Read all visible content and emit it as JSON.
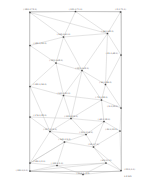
{
  "figure": {
    "type": "node-link-graph",
    "background_color": "#ffffff",
    "frame_color": "#9a9a9a",
    "edge_color": "#b0b0b0",
    "node_color": "#444444",
    "label_color": "#5a5a5a",
    "width": 146,
    "height": 187,
    "frame": {
      "x": 29.5,
      "y": 11.5,
      "width": 92,
      "height": 160
    }
  },
  "chart_data": {
    "type": "scatter",
    "title": "",
    "xlabel": "",
    "ylabel": "",
    "grid": false,
    "legend": "none",
    "nodes": [
      {
        "id": "n1",
        "label": "(-180.0,72.0)",
        "x": 30.0,
        "y": 12.5,
        "label_x": 30.0,
        "label_y": 10.0,
        "label_align": "center"
      },
      {
        "id": "n2",
        "label": "(-131.0,71.0)",
        "x": 75.5,
        "y": 11.5,
        "label_x": 75.5,
        "label_y": 10.0,
        "label_align": "center"
      },
      {
        "id": "n3",
        "label": "(-2.0,71.0)",
        "x": 120.5,
        "y": 12.0,
        "label_x": 120.5,
        "label_y": 10.0,
        "label_align": "center"
      },
      {
        "id": "n4",
        "label": "(-44.0,62.0)",
        "x": 107.5,
        "y": 33.5,
        "label_x": 107.5,
        "label_y": 31.5,
        "label_align": "center"
      },
      {
        "id": "n5",
        "label": "(-149.0,61.0)",
        "x": 63.5,
        "y": 37.0,
        "label_x": 63.5,
        "label_y": 35.0,
        "label_align": "center"
      },
      {
        "id": "n6",
        "label": "(-181.0,55.0)",
        "x": 30.0,
        "y": 45.5,
        "label_x": 33.0,
        "label_y": 44.0,
        "label_align": "left"
      },
      {
        "id": "n7",
        "label": "(-21.0,48.0)",
        "x": 121.0,
        "y": 55.0,
        "label_x": 118.0,
        "label_y": 53.5,
        "label_align": "right"
      },
      {
        "id": "n8",
        "label": "(-155.0,48.0)",
        "x": 56.0,
        "y": 63.0,
        "label_x": 56.0,
        "label_y": 61.0,
        "label_align": "center"
      },
      {
        "id": "n9",
        "label": "(-121.0,42.0)",
        "x": 82.0,
        "y": 70.5,
        "label_x": 82.0,
        "label_y": 68.5,
        "label_align": "center"
      },
      {
        "id": "n10",
        "label": "(-60.0,36.0)",
        "x": 105.5,
        "y": 84.5,
        "label_x": 105.5,
        "label_y": 82.5,
        "label_align": "center"
      },
      {
        "id": "n11",
        "label": "(-181.0,34.0)",
        "x": 30.0,
        "y": 86.5,
        "label_x": 33.0,
        "label_y": 85.0,
        "label_align": "left"
      },
      {
        "id": "n12",
        "label": "(-141.0,31.0)",
        "x": 63.5,
        "y": 95.5,
        "label_x": 63.5,
        "label_y": 93.5,
        "label_align": "center"
      },
      {
        "id": "n13",
        "label": "(-73.0,28.0)",
        "x": 101.5,
        "y": 100.0,
        "label_x": 101.5,
        "label_y": 98.0,
        "label_align": "center"
      },
      {
        "id": "n14",
        "label": "(-9.0,25.0)",
        "x": 121.0,
        "y": 108.0,
        "label_x": 118.0,
        "label_y": 106.5,
        "label_align": "right"
      },
      {
        "id": "n15",
        "label": "(-176.0,22.0)",
        "x": 30.0,
        "y": 117.0,
        "label_x": 33.0,
        "label_y": 115.5,
        "label_align": "left"
      },
      {
        "id": "n16",
        "label": "(-135.0,22.0)",
        "x": 71.0,
        "y": 118.5,
        "label_x": 71.0,
        "label_y": 116.5,
        "label_align": "center"
      },
      {
        "id": "n17",
        "label": "(-62.0,18.0)",
        "x": 104.0,
        "y": 121.5,
        "label_x": 104.0,
        "label_y": 119.5,
        "label_align": "center"
      },
      {
        "id": "n18",
        "label": "(-157.0,15.0)",
        "x": 50.0,
        "y": 131.5,
        "label_x": 50.0,
        "label_y": 129.5,
        "label_align": "center"
      },
      {
        "id": "n19",
        "label": "(-110.0,14.0)",
        "x": 86.0,
        "y": 134.5,
        "label_x": 86.0,
        "label_y": 132.5,
        "label_align": "center"
      },
      {
        "id": "n20",
        "label": "(-30.0,13.0)",
        "x": 120.0,
        "y": 131.0,
        "label_x": 117.5,
        "label_y": 129.5,
        "label_align": "right"
      },
      {
        "id": "n21",
        "label": "(-145.0,9.0)",
        "x": 64.5,
        "y": 142.0,
        "label_x": 64.5,
        "label_y": 140.0,
        "label_align": "center"
      },
      {
        "id": "n22",
        "label": "(-95.0,7.0)",
        "x": 93.5,
        "y": 147.0,
        "label_x": 93.5,
        "label_y": 145.0,
        "label_align": "center"
      },
      {
        "id": "n23",
        "label": "(-180.0,2.0)",
        "x": 30.0,
        "y": 163.0,
        "label_x": 33.0,
        "label_y": 161.5,
        "label_align": "left"
      },
      {
        "id": "n24",
        "label": "(-152.0,1.0)",
        "x": 57.0,
        "y": 165.5,
        "label_x": 57.0,
        "label_y": 163.5,
        "label_align": "center"
      },
      {
        "id": "n25",
        "label": "(-69.0,1.0)",
        "x": 106.0,
        "y": 163.0,
        "label_x": 106.0,
        "label_y": 161.0,
        "label_align": "center"
      },
      {
        "id": "n26",
        "label": "(-180.0,0.0)",
        "x": 30.0,
        "y": 171.0,
        "label_x": 28.0,
        "label_y": 170.5,
        "label_align": "right"
      },
      {
        "id": "n27",
        "label": "(-22.0,0.0)",
        "x": 121.0,
        "y": 170.5,
        "label_x": 124.0,
        "label_y": 170.0,
        "label_align": "left"
      },
      {
        "id": "n28",
        "label": "(-114.0,-1.0)",
        "x": 83.0,
        "y": 174.5,
        "label_x": 83.0,
        "label_y": 174.0,
        "label_align": "center"
      }
    ],
    "edges": [
      [
        "n1",
        "n2"
      ],
      [
        "n2",
        "n3"
      ],
      [
        "n1",
        "n6"
      ],
      [
        "n3",
        "n4"
      ],
      [
        "n1",
        "n4"
      ],
      [
        "n2",
        "n4"
      ],
      [
        "n1",
        "n5"
      ],
      [
        "n4",
        "n5"
      ],
      [
        "n5",
        "n6"
      ],
      [
        "n5",
        "n8"
      ],
      [
        "n6",
        "n8"
      ],
      [
        "n4",
        "n9"
      ],
      [
        "n5",
        "n9"
      ],
      [
        "n8",
        "n9"
      ],
      [
        "n3",
        "n7"
      ],
      [
        "n4",
        "n7"
      ],
      [
        "n7",
        "n10"
      ],
      [
        "n4",
        "n10"
      ],
      [
        "n9",
        "n10"
      ],
      [
        "n6",
        "n11"
      ],
      [
        "n8",
        "n11"
      ],
      [
        "n8",
        "n12"
      ],
      [
        "n11",
        "n12"
      ],
      [
        "n9",
        "n12"
      ],
      [
        "n9",
        "n13"
      ],
      [
        "n12",
        "n13"
      ],
      [
        "n10",
        "n13"
      ],
      [
        "n7",
        "n14"
      ],
      [
        "n10",
        "n14"
      ],
      [
        "n13",
        "n14"
      ],
      [
        "n11",
        "n15"
      ],
      [
        "n12",
        "n16"
      ],
      [
        "n15",
        "n16"
      ],
      [
        "n13",
        "n17"
      ],
      [
        "n16",
        "n17"
      ],
      [
        "n13",
        "n16"
      ],
      [
        "n14",
        "n20"
      ],
      [
        "n17",
        "n20"
      ],
      [
        "n15",
        "n18"
      ],
      [
        "n16",
        "n18"
      ],
      [
        "n16",
        "n19"
      ],
      [
        "n18",
        "n19"
      ],
      [
        "n17",
        "n19"
      ],
      [
        "n19",
        "n22"
      ],
      [
        "n18",
        "n21"
      ],
      [
        "n19",
        "n21"
      ],
      [
        "n21",
        "n22"
      ],
      [
        "n17",
        "n22"
      ],
      [
        "n20",
        "n22"
      ],
      [
        "n15",
        "n23"
      ],
      [
        "n18",
        "n23"
      ],
      [
        "n21",
        "n23"
      ],
      [
        "n23",
        "n24"
      ],
      [
        "n21",
        "n24"
      ],
      [
        "n23",
        "n26"
      ],
      [
        "n24",
        "n26"
      ],
      [
        "n22",
        "n25"
      ],
      [
        "n25",
        "n27"
      ],
      [
        "n20",
        "n27"
      ],
      [
        "n22",
        "n27"
      ],
      [
        "n24",
        "n25"
      ],
      [
        "n26",
        "n28"
      ],
      [
        "n24",
        "n28"
      ],
      [
        "n25",
        "n28"
      ],
      [
        "n27",
        "n28"
      ],
      [
        "n23",
        "n21"
      ],
      [
        "n26",
        "n25"
      ],
      [
        "n12",
        "n18"
      ],
      [
        "n11",
        "n18"
      ],
      [
        "n5",
        "n2"
      ],
      [
        "n9",
        "n16"
      ]
    ],
    "scale_annotation": {
      "value": "1.0",
      "unit": "km"
    }
  }
}
